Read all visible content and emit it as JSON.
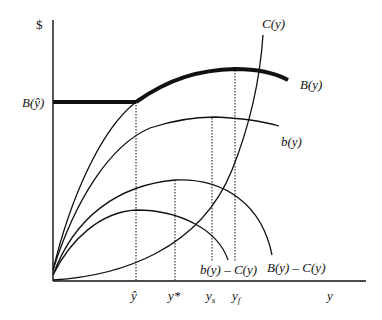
{
  "diagram": {
    "axes": {
      "y_axis_label": "$",
      "x_axis_label": "y"
    },
    "y_axis_marks": [
      {
        "label": "B(ŷ)",
        "y_px": 102
      }
    ],
    "x_axis_marks": [
      {
        "key": "y_hat",
        "label": "ŷ",
        "x_px": 136
      },
      {
        "key": "y_star",
        "label": "y*",
        "x_px": 175
      },
      {
        "key": "y_s",
        "label": "y",
        "sub": "s",
        "x_px": 212
      },
      {
        "key": "y_f",
        "label": "y",
        "sub": "f",
        "x_px": 235
      }
    ],
    "curve_labels": {
      "C": "C(y)",
      "B": "B(y)",
      "b": "b(y)",
      "b_minus_C": "b(y) – C(y)",
      "B_minus_C": "B(y) – C(y)"
    },
    "colors": {
      "stroke": "#111111",
      "background": "#ffffff"
    }
  }
}
